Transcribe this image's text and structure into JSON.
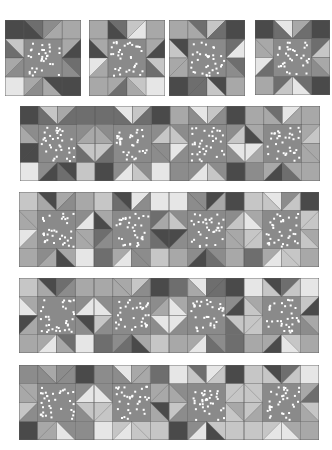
{
  "canvas": {
    "width": 332,
    "height": 450,
    "background": "#ffffff"
  },
  "palette": {
    "dark": "#4a4a4a",
    "darkmid": "#6e6e6e",
    "mid": "#8c8c8c",
    "lightmid": "#a8a8a8",
    "light": "#c6c6c6",
    "pale": "#e6e6e6",
    "center": "#8a8a8a",
    "dot": "#ffffff",
    "seam": "#5a5a5a"
  },
  "single_blocks": [
    {
      "x": 5,
      "y": 20,
      "size": 76,
      "corners": [
        "dark",
        "lightmid",
        "pale",
        "dark"
      ],
      "points": {
        "top": [
          "darkmid",
          "mid"
        ],
        "bottom": [
          "mid",
          "lightmid"
        ],
        "left": [
          "darkmid",
          "lightmid"
        ],
        "right": [
          "dark",
          "darkmid"
        ]
      },
      "bg": [
        "dark",
        "lightmid",
        "light",
        "lightmid",
        "mid",
        "mid",
        "lightmid",
        "dark"
      ]
    },
    {
      "x": 89,
      "y": 20,
      "size": 76,
      "corners": [
        "lightmid",
        "lightmid",
        "lightmid",
        "pale"
      ],
      "points": {
        "top": [
          "darkmid",
          "light"
        ],
        "bottom": [
          "darkmid",
          "lightmid"
        ],
        "left": [
          "dark",
          "pale"
        ],
        "right": [
          "dark",
          "light"
        ]
      },
      "bg": [
        "dark",
        "pale",
        "lightmid",
        "lightmid",
        "lightmid",
        "darkmid",
        "lightmid",
        "light"
      ]
    },
    {
      "x": 169,
      "y": 20,
      "size": 76,
      "corners": [
        "lightmid",
        "dark",
        "dark",
        "lightmid"
      ],
      "points": {
        "top": [
          "darkmid",
          "light"
        ],
        "bottom": [
          "darkmid",
          "light"
        ],
        "left": [
          "light",
          "lightmid"
        ],
        "right": [
          "pale",
          "darkmid"
        ]
      },
      "bg": [
        "lightmid",
        "darkmid",
        "dark",
        "darkmid",
        "lightmid",
        "mid",
        "darkmid",
        "dark"
      ]
    },
    {
      "x": 255,
      "y": 20,
      "size": 75,
      "corners": [
        "dark",
        "dark",
        "lightmid",
        "dark"
      ],
      "points": {
        "top": [
          "pale",
          "lightmid"
        ],
        "bottom": [
          "light",
          "pale"
        ],
        "left": [
          "lightmid",
          "pale"
        ],
        "right": [
          "light",
          "lightmid"
        ]
      },
      "bg": [
        "darkmid",
        "darkmid",
        "lightmid",
        "darkmid",
        "darkmid",
        "mid",
        "darkmid",
        "darkmid"
      ]
    }
  ],
  "rows": [
    {
      "x": 20,
      "y": 106,
      "block_size": 75,
      "gap": 0,
      "blocks": [
        {
          "corners": [
            "dark",
            "darkmid",
            "pale",
            "light"
          ],
          "points": {
            "top": [
              "light",
              "lightmid"
            ],
            "bottom": [
              "dark",
              "darkmid"
            ],
            "left": [
              "lightmid",
              "dark"
            ],
            "right": [
              "lightmid",
              "light"
            ]
          },
          "bg": [
            "darkmid",
            "darkmid",
            "mid",
            "mid",
            "dark",
            "darkmid",
            "mid",
            "dark"
          ]
        },
        {
          "corners": [
            "darkmid",
            "dark",
            "dark",
            "pale"
          ],
          "points": {
            "top": [
              "pale",
              "light"
            ],
            "bottom": [
              "pale",
              "light"
            ],
            "left": [
              "lightmid",
              "light"
            ],
            "right": [
              "light",
              "mid"
            ]
          },
          "bg": [
            "darkmid",
            "darkmid",
            "mid",
            "mid",
            "darkmid",
            "mid",
            "mid",
            "mid"
          ]
        },
        {
          "corners": [
            "lightmid",
            "dark",
            "mid",
            "dark"
          ],
          "points": {
            "top": [
              "pale",
              "light"
            ],
            "bottom": [
              "pale",
              "light"
            ],
            "left": [
              "light",
              "pale"
            ],
            "right": [
              "light",
              "pale"
            ]
          },
          "bg": [
            "mid",
            "mid",
            "mid",
            "mid",
            "mid",
            "mid",
            "mid",
            "mid"
          ]
        },
        {
          "corners": [
            "lightmid",
            "lightmid",
            "mid",
            "lightmid"
          ],
          "points": {
            "top": [
              "darkmid",
              "pale"
            ],
            "bottom": [
              "dark",
              "darkmid"
            ],
            "left": [
              "dark",
              "pale"
            ],
            "right": [
              "light",
              "lightmid"
            ]
          },
          "bg": [
            "lightmid",
            "lightmid",
            "lightmid",
            "lightmid",
            "lightmid",
            "lightmid",
            "lightmid",
            "lightmid"
          ]
        }
      ]
    },
    {
      "x": 19,
      "y": 192,
      "block_size": 75,
      "gap": 0,
      "blocks": [
        {
          "corners": [
            "light",
            "lightmid",
            "lightmid",
            "pale"
          ],
          "points": {
            "top": [
              "dark",
              "lightmid"
            ],
            "bottom": [
              "lightmid",
              "dark"
            ],
            "left": [
              "lightmid",
              "pale"
            ],
            "right": [
              "pale",
              "lightmid"
            ]
          },
          "bg": [
            "lightmid",
            "mid",
            "lightmid",
            "mid",
            "lightmid",
            "lightmid",
            "mid",
            "lightmid"
          ]
        },
        {
          "corners": [
            "light",
            "pale",
            "darkmid",
            "light"
          ],
          "points": {
            "top": [
              "dark",
              "pale"
            ],
            "bottom": [
              "pale",
              "mid"
            ],
            "left": [
              "dark",
              "darkmid"
            ],
            "right": [
              "lightmid",
              "dark"
            ]
          },
          "bg": [
            "darkmid",
            "mid",
            "lightmid",
            "darkmid",
            "mid",
            "darkmid",
            "lightmid",
            "mid"
          ]
        },
        {
          "corners": [
            "pale",
            "dark",
            "lightmid",
            "lightmid"
          ],
          "points": {
            "top": [
              "mid",
              "dark"
            ],
            "bottom": [
              "dark",
              "darkmid"
            ],
            "left": [
              "light",
              "dark"
            ],
            "right": [
              "light",
              "lightmid"
            ]
          },
          "bg": [
            "mid",
            "lightmid",
            "mid",
            "mid",
            "mid",
            "lightmid",
            "mid",
            "mid"
          ]
        },
        {
          "corners": [
            "light",
            "dark",
            "darkmid",
            "lightmid"
          ],
          "points": {
            "top": [
              "pale",
              "mid"
            ],
            "bottom": [
              "pale",
              "light"
            ],
            "left": [
              "pale",
              "light"
            ],
            "right": [
              "light",
              "lightmid"
            ]
          },
          "bg": [
            "light",
            "light",
            "lightmid",
            "light",
            "light",
            "light",
            "lightmid",
            "light"
          ]
        }
      ]
    },
    {
      "x": 19,
      "y": 278,
      "block_size": 75,
      "gap": 0,
      "blocks": [
        {
          "corners": [
            "light",
            "lightmid",
            "lightmid",
            "pale"
          ],
          "points": {
            "top": [
              "dark",
              "darkmid"
            ],
            "bottom": [
              "pale",
              "lightmid"
            ],
            "left": [
              "pale",
              "dark"
            ],
            "right": [
              "pale",
              "dark"
            ]
          },
          "bg": [
            "lightmid",
            "mid",
            "lightmid",
            "mid",
            "lightmid",
            "mid",
            "lightmid",
            "darkmid"
          ]
        },
        {
          "corners": [
            "lightmid",
            "dark",
            "darkmid",
            "light"
          ],
          "points": {
            "top": [
              "lightmid",
              "light"
            ],
            "bottom": [
              "darkmid",
              "dark"
            ],
            "left": [
              "pale",
              "light"
            ],
            "right": [
              "lightmid",
              "pale"
            ]
          },
          "bg": [
            "lightmid",
            "mid",
            "mid",
            "mid",
            "mid",
            "mid",
            "mid",
            "lightmid"
          ]
        },
        {
          "corners": [
            "darkmid",
            "dark",
            "lightmid",
            "darkmid"
          ],
          "points": {
            "top": [
              "pale",
              "darkmid"
            ],
            "bottom": [
              "pale",
              "darkmid"
            ],
            "left": [
              "pale",
              "pale"
            ],
            "right": [
              "dark",
              "light"
            ]
          },
          "bg": [
            "lightmid",
            "darkmid",
            "lightmid",
            "mid",
            "mid",
            "darkmid",
            "lightmid",
            "mid"
          ]
        },
        {
          "corners": [
            "pale",
            "pale",
            "lightmid",
            "lightmid"
          ],
          "points": {
            "top": [
              "dark",
              "darkmid"
            ],
            "bottom": [
              "dark",
              "pale"
            ],
            "left": [
              "light",
              "light"
            ],
            "right": [
              "dark",
              "lightmid"
            ]
          },
          "bg": [
            "light",
            "light",
            "lightmid",
            "light",
            "light",
            "mid",
            "lightmid",
            "light"
          ]
        }
      ]
    },
    {
      "x": 19,
      "y": 365,
      "block_size": 75,
      "gap": 0,
      "blocks": [
        {
          "corners": [
            "mid",
            "dark",
            "dark",
            "mid"
          ],
          "points": {
            "top": [
              "lightmid",
              "mid"
            ],
            "bottom": [
              "lightmid",
              "pale"
            ],
            "left": [
              "lightmid",
              "light"
            ],
            "right": [
              "pale",
              "light"
            ]
          },
          "bg": [
            "mid",
            "mid",
            "lightmid",
            "mid",
            "mid",
            "mid",
            "lightmid",
            "mid"
          ]
        },
        {
          "corners": [
            "mid",
            "darkmid",
            "pale",
            "light"
          ],
          "points": {
            "top": [
              "pale",
              "lightmid"
            ],
            "bottom": [
              "pale",
              "light"
            ],
            "left": [
              "pale",
              "light"
            ],
            "right": [
              "lightmid",
              "dark"
            ]
          },
          "bg": [
            "mid",
            "lightmid",
            "mid",
            "lightmid",
            "light",
            "lightmid",
            "light",
            "light"
          ]
        },
        {
          "corners": [
            "pale",
            "dark",
            "dark",
            "light"
          ],
          "points": {
            "top": [
              "darkmid",
              "pale"
            ],
            "bottom": [
              "pale",
              "dark"
            ],
            "left": [
              "lightmid",
              "light"
            ],
            "right": [
              "light",
              "lightmid"
            ]
          },
          "bg": [
            "light",
            "light",
            "mid",
            "light",
            "mid",
            "light",
            "mid",
            "light"
          ]
        },
        {
          "corners": [
            "light",
            "pale",
            "light",
            "lightmid"
          ],
          "points": {
            "top": [
              "dark",
              "darkmid"
            ],
            "bottom": [
              "pale",
              "pale"
            ],
            "left": [
              "light",
              "light"
            ],
            "right": [
              "darkmid",
              "light"
            ]
          },
          "bg": [
            "light",
            "light",
            "light",
            "lightmid",
            "lightmid",
            "lightmid",
            "light",
            "lightmid"
          ]
        }
      ]
    }
  ],
  "dots_per_center": 34
}
